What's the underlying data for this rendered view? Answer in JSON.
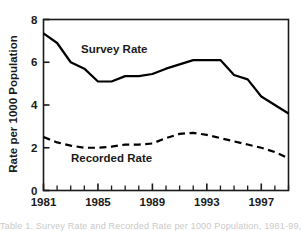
{
  "chart_data": {
    "type": "line",
    "title": "",
    "xlabel": "",
    "ylabel": "Rate per 1000 Population",
    "xlim": [
      1981,
      1999
    ],
    "ylim": [
      0,
      8
    ],
    "yticks": [
      0,
      2,
      4,
      6,
      8
    ],
    "ytick_labels": [
      "0",
      "2",
      "4",
      "6",
      "8"
    ],
    "xticks": [
      1981,
      1985,
      1989,
      1993,
      1997
    ],
    "xtick_labels": [
      "1981",
      "1985",
      "1989",
      "1993",
      "1997"
    ],
    "xminor_ticks": [
      1982,
      1983,
      1984,
      1986,
      1987,
      1988,
      1990,
      1991,
      1992,
      1994,
      1995,
      1996,
      1998,
      1999
    ],
    "grid": false,
    "legend_position": "inline-annotations",
    "x": [
      1981,
      1982,
      1983,
      1984,
      1985,
      1986,
      1987,
      1988,
      1989,
      1990,
      1991,
      1992,
      1993,
      1994,
      1995,
      1996,
      1997,
      1998,
      1999
    ],
    "series": [
      {
        "name": "Survey Rate",
        "style": "solid",
        "color": "#000000",
        "values": [
          7.35,
          6.9,
          6.0,
          5.7,
          5.1,
          5.1,
          5.35,
          5.35,
          5.45,
          5.7,
          5.9,
          6.1,
          6.1,
          6.1,
          5.4,
          5.2,
          4.4,
          4.0,
          3.6
        ],
        "label_x": 1986.2,
        "label_y": 6.45
      },
      {
        "name": "Recorded Rate",
        "style": "dashed",
        "color": "#000000",
        "values": [
          2.5,
          2.25,
          2.1,
          2.0,
          2.0,
          2.05,
          2.15,
          2.15,
          2.2,
          2.45,
          2.65,
          2.7,
          2.6,
          2.45,
          2.3,
          2.15,
          2.0,
          1.8,
          1.5
        ],
        "label_x": 1986.0,
        "label_y": 1.35
      }
    ]
  },
  "figure": {
    "caption_fragment": "Table 1. Survey Rate and Recorded Rate per 1000 Population, 1981-99, Source: A"
  }
}
